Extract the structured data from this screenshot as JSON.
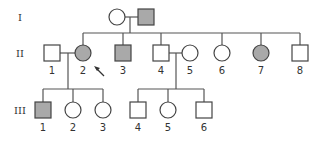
{
  "diagram": {
    "type": "pedigree",
    "colors": {
      "affected": "#a9a9a9",
      "unaffected": "#ffffff",
      "stroke": "#444444"
    },
    "generations": [
      {
        "label": "I",
        "individuals": [
          {
            "id": "I-1",
            "label": "",
            "sex": "female",
            "affected": false
          },
          {
            "id": "I-2",
            "label": "",
            "sex": "male",
            "affected": true
          }
        ]
      },
      {
        "label": "II",
        "individuals": [
          {
            "id": "II-1",
            "label": "1",
            "sex": "male",
            "affected": false
          },
          {
            "id": "II-2",
            "label": "2",
            "sex": "female",
            "affected": true,
            "proband": true
          },
          {
            "id": "II-3",
            "label": "3",
            "sex": "male",
            "affected": true
          },
          {
            "id": "II-4",
            "label": "4",
            "sex": "male",
            "affected": false
          },
          {
            "id": "II-5",
            "label": "5",
            "sex": "female",
            "affected": false
          },
          {
            "id": "II-6",
            "label": "6",
            "sex": "female",
            "affected": false
          },
          {
            "id": "II-7",
            "label": "7",
            "sex": "female",
            "affected": true
          },
          {
            "id": "II-8",
            "label": "8",
            "sex": "male",
            "affected": false
          }
        ]
      },
      {
        "label": "III",
        "individuals": [
          {
            "id": "III-1",
            "label": "1",
            "sex": "male",
            "affected": true
          },
          {
            "id": "III-2",
            "label": "2",
            "sex": "female",
            "affected": false
          },
          {
            "id": "III-3",
            "label": "3",
            "sex": "female",
            "affected": false
          },
          {
            "id": "III-4",
            "label": "4",
            "sex": "male",
            "affected": false
          },
          {
            "id": "III-5",
            "label": "5",
            "sex": "female",
            "affected": false
          },
          {
            "id": "III-6",
            "label": "6",
            "sex": "male",
            "affected": false
          }
        ]
      }
    ],
    "matings": [
      {
        "partners": [
          "I-1",
          "I-2"
        ],
        "children": [
          "II-2",
          "II-3",
          "II-4",
          "II-6",
          "II-7",
          "II-8"
        ]
      },
      {
        "partners": [
          "II-1",
          "II-2"
        ],
        "children": [
          "III-1",
          "III-2",
          "III-3"
        ]
      },
      {
        "partners": [
          "II-4",
          "II-5"
        ],
        "children": [
          "III-4",
          "III-5",
          "III-6"
        ]
      }
    ],
    "proband_marker": "arrow"
  }
}
